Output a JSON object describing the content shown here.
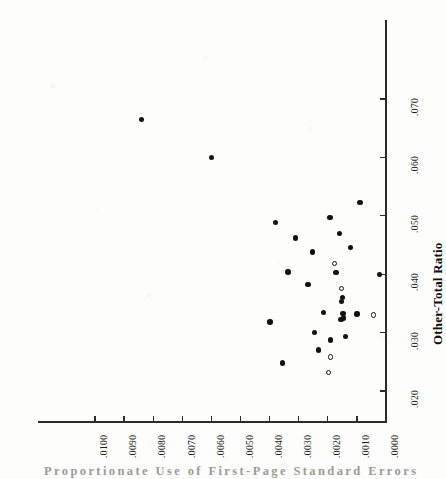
{
  "chart_data": {
    "type": "scatter",
    "title": "",
    "xlabel": "Proportionate Use of First-Page Standard Errors",
    "ylabel": "Other-Total Ratio",
    "orientation": "rotated-90-scan",
    "xlim": [
      0.0,
      0.0105
    ],
    "ylim": [
      0.0165,
      0.0745
    ],
    "x_axis_reversed": true,
    "grid": false,
    "legend": null,
    "xticks": [
      ".0100",
      ".0090",
      ".0080",
      ".0070",
      ".0060",
      ".0050",
      ".0040",
      ".0030",
      ".0020",
      ".0010",
      ".0000"
    ],
    "xtick_values": [
      0.01,
      0.009,
      0.008,
      0.007,
      0.006,
      0.005,
      0.004,
      0.003,
      0.002,
      0.001,
      0.0
    ],
    "yticks": [
      ".020",
      ".030",
      ".040",
      ".050",
      ".060",
      ".070"
    ],
    "ytick_values": [
      0.02,
      0.03,
      0.04,
      0.05,
      0.06,
      0.07
    ],
    "marker_styles": [
      "filled-circle",
      "open-circle"
    ],
    "n_points": 31,
    "points": [
      {
        "x": 0.0084,
        "y": 0.0665,
        "marker": "filled"
      },
      {
        "x": 0.006,
        "y": 0.06,
        "marker": "filled"
      },
      {
        "x": 0.0038,
        "y": 0.0488,
        "marker": "filled"
      },
      {
        "x": 0.00192,
        "y": 0.0497,
        "marker": "filled"
      },
      {
        "x": 0.0009,
        "y": 0.0523,
        "marker": "filled"
      },
      {
        "x": 0.0031,
        "y": 0.0462,
        "marker": "filled"
      },
      {
        "x": 0.0016,
        "y": 0.047,
        "marker": "filled"
      },
      {
        "x": 0.00252,
        "y": 0.0438,
        "marker": "filled"
      },
      {
        "x": 0.00122,
        "y": 0.0446,
        "marker": "filled"
      },
      {
        "x": 0.00178,
        "y": 0.0418,
        "marker": "open"
      },
      {
        "x": 0.00337,
        "y": 0.0404,
        "marker": "filled"
      },
      {
        "x": 0.00172,
        "y": 0.0403,
        "marker": "filled"
      },
      {
        "x": 0.00022,
        "y": 0.04,
        "marker": "filled"
      },
      {
        "x": 0.00268,
        "y": 0.0382,
        "marker": "filled"
      },
      {
        "x": 0.00152,
        "y": 0.0375,
        "marker": "open"
      },
      {
        "x": 0.0015,
        "y": 0.036,
        "marker": "filled"
      },
      {
        "x": 0.00152,
        "y": 0.0353,
        "marker": "filled"
      },
      {
        "x": 0.00215,
        "y": 0.0334,
        "marker": "filled"
      },
      {
        "x": 0.00148,
        "y": 0.0333,
        "marker": "filled"
      },
      {
        "x": 0.001,
        "y": 0.0332,
        "marker": "filled"
      },
      {
        "x": 0.00042,
        "y": 0.033,
        "marker": "open"
      },
      {
        "x": 0.00145,
        "y": 0.0325,
        "marker": "filled"
      },
      {
        "x": 0.00155,
        "y": 0.0322,
        "marker": "filled"
      },
      {
        "x": 0.00398,
        "y": 0.0318,
        "marker": "filled"
      },
      {
        "x": 0.00245,
        "y": 0.03,
        "marker": "filled"
      },
      {
        "x": 0.0019,
        "y": 0.0287,
        "marker": "filled"
      },
      {
        "x": 0.0014,
        "y": 0.0293,
        "marker": "filled"
      },
      {
        "x": 0.00232,
        "y": 0.027,
        "marker": "filled"
      },
      {
        "x": 0.0019,
        "y": 0.0258,
        "marker": "open"
      },
      {
        "x": 0.00355,
        "y": 0.0248,
        "marker": "filled"
      },
      {
        "x": 0.00198,
        "y": 0.0232,
        "marker": "open"
      }
    ]
  },
  "axes": {
    "x_title": "Proportionate Use of First-Page Standard Errors",
    "y_title": "Other-Total Ratio"
  }
}
